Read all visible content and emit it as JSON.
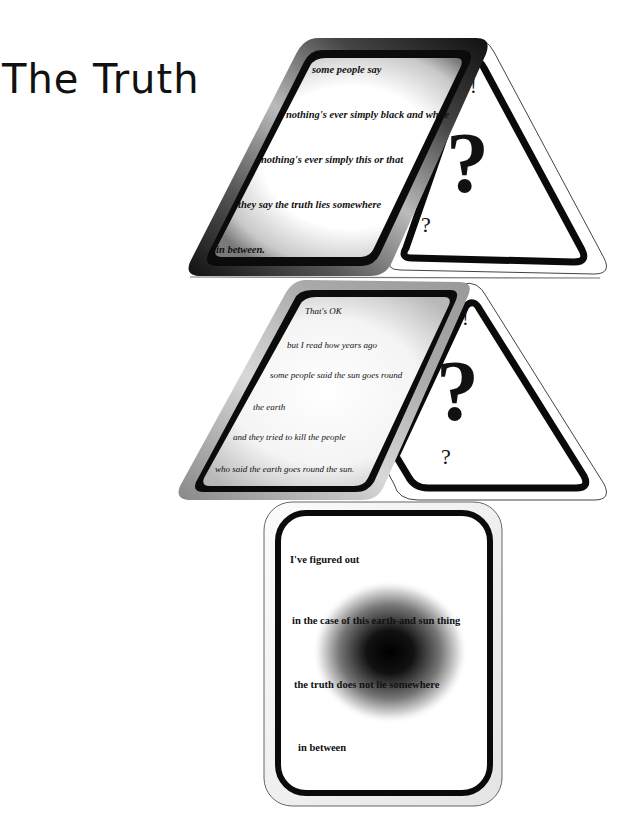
{
  "title": "The Truth",
  "colors": {
    "ink": "#111111",
    "background": "#ffffff",
    "card_border": "#0a0a0a",
    "outline": "#555555"
  },
  "cards": {
    "top": {
      "shape": "skewed-card",
      "lines": [
        "some people say",
        "nothing's ever simply black and white",
        "nothing's ever simply this or that",
        "they say the truth lies somewhere",
        "in between."
      ]
    },
    "top_triangle": {
      "shape": "triangle-card",
      "symbols": [
        "!",
        "?",
        "?"
      ]
    },
    "middle": {
      "shape": "skewed-card",
      "lines": [
        "That's OK",
        "but I read how years ago",
        "some people said the sun goes round",
        "the earth",
        "and they tried to kill the people",
        "who said the earth goes round the sun."
      ]
    },
    "middle_triangle": {
      "shape": "triangle-card",
      "symbols": [
        "!",
        "?",
        "?"
      ]
    },
    "bottom": {
      "shape": "upright-card",
      "lines": [
        "I've figured out",
        "in the case of this earth-and sun thing",
        "the truth does not lie somewhere",
        "in between"
      ]
    }
  }
}
